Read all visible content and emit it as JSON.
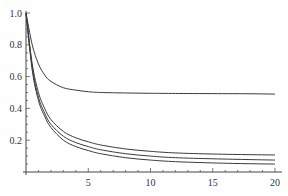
{
  "chart_data": {
    "type": "line",
    "title": "",
    "xlabel": "",
    "ylabel": "",
    "xlim": [
      0,
      20
    ],
    "ylim": [
      0,
      1.0
    ],
    "grid": false,
    "legend": null,
    "x_ticks": [
      5,
      10,
      15,
      20
    ],
    "x_tick_labels": [
      "5",
      "10",
      "15",
      "20"
    ],
    "y_ticks": [
      0.2,
      0.4,
      0.6,
      0.8,
      1.0
    ],
    "y_tick_labels": [
      "0.2",
      "0.4",
      "0.6",
      "0.8",
      "1.0"
    ],
    "x": [
      0,
      0.5,
      1,
      1.5,
      2,
      3,
      4,
      5,
      6,
      8,
      10,
      12,
      15,
      18,
      20
    ],
    "series": [
      {
        "name": "curve-1",
        "values": [
          1.0,
          0.8,
          0.68,
          0.61,
          0.57,
          0.53,
          0.515,
          0.505,
          0.5,
          0.497,
          0.495,
          0.494,
          0.493,
          0.492,
          0.49
        ]
      },
      {
        "name": "curve-2",
        "values": [
          1.0,
          0.68,
          0.5,
          0.4,
          0.33,
          0.255,
          0.215,
          0.19,
          0.17,
          0.145,
          0.13,
          0.12,
          0.113,
          0.109,
          0.107
        ]
      },
      {
        "name": "curve-3",
        "values": [
          1.0,
          0.66,
          0.47,
          0.37,
          0.3,
          0.225,
          0.185,
          0.16,
          0.14,
          0.115,
          0.1,
          0.09,
          0.083,
          0.078,
          0.075
        ]
      },
      {
        "name": "curve-4",
        "values": [
          1.0,
          0.64,
          0.45,
          0.35,
          0.28,
          0.2,
          0.16,
          0.135,
          0.115,
          0.09,
          0.075,
          0.065,
          0.057,
          0.052,
          0.05
        ]
      }
    ]
  }
}
